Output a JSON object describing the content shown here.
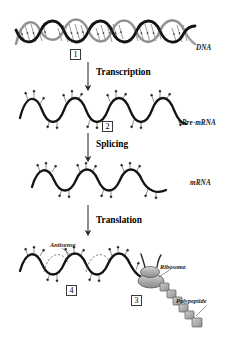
{
  "figure": {
    "background_color": "#ffffff",
    "ink_color": "#1a1a1a"
  },
  "molecules": [
    {
      "id": "dna",
      "label": "DNA",
      "x": 196,
      "y": 45
    },
    {
      "id": "pre_mrna",
      "label": "Pre-mRNA",
      "x": 186,
      "y": 122
    },
    {
      "id": "mrna",
      "label": "mRNA",
      "x": 190,
      "y": 180
    }
  ],
  "processes": [
    {
      "id": "transcription",
      "label": "Transcription",
      "x": 96,
      "y": 70
    },
    {
      "id": "splicing",
      "label": "Splicing",
      "x": 96,
      "y": 141
    },
    {
      "id": "translation",
      "label": "Translation",
      "x": 96,
      "y": 217
    }
  ],
  "steps": [
    {
      "id": "step-1",
      "label": "1",
      "x": 70,
      "y": 50
    },
    {
      "id": "step-2",
      "label": "2",
      "x": 102,
      "y": 122
    },
    {
      "id": "step-3",
      "label": "3",
      "x": 131,
      "y": 296
    },
    {
      "id": "step-4",
      "label": "4",
      "x": 66,
      "y": 286
    }
  ],
  "annotations": [
    {
      "id": "antisense",
      "label": "Antisense",
      "x": 50,
      "y": 243
    },
    {
      "id": "ribosome",
      "label": "Ribosome",
      "x": 160,
      "y": 266
    },
    {
      "id": "polypeptide",
      "label": "Polypeptide",
      "x": 179,
      "y": 300
    }
  ],
  "colors": {
    "strand_dark": "#1a1a1a",
    "strand_light": "#9a9a9a",
    "ribosome_fill": "#b4b4b4",
    "peptide_fill": "#a8a8a8",
    "arrow": "#2a2a2a"
  }
}
